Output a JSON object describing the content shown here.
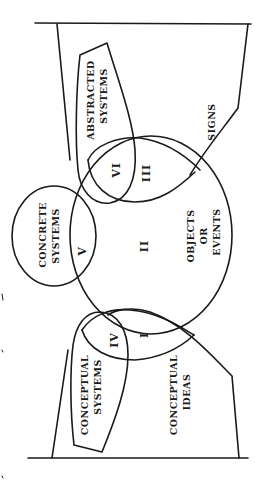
{
  "diagram": {
    "orientation": "rotated 90 degrees counter-clockwise",
    "sets": {
      "signs": "SIGNS",
      "abstracted_systems": [
        "ABSTRACTED",
        "SYSTEMS"
      ],
      "concrete_systems": [
        "CONCRETE",
        "SYSTEMS"
      ],
      "objects_or_events": [
        "OBJECTS",
        "OR",
        "EVENTS"
      ],
      "conceptual_systems": [
        "CONCEPTUAL",
        "SYSTEMS"
      ],
      "conceptual_ideas": [
        "CONCEPTUAL",
        "IDEAS"
      ]
    },
    "regions": {
      "r1": "I",
      "r2": "II",
      "r3": "III",
      "r4": "IV",
      "r5": "V",
      "r6": "VI"
    }
  }
}
